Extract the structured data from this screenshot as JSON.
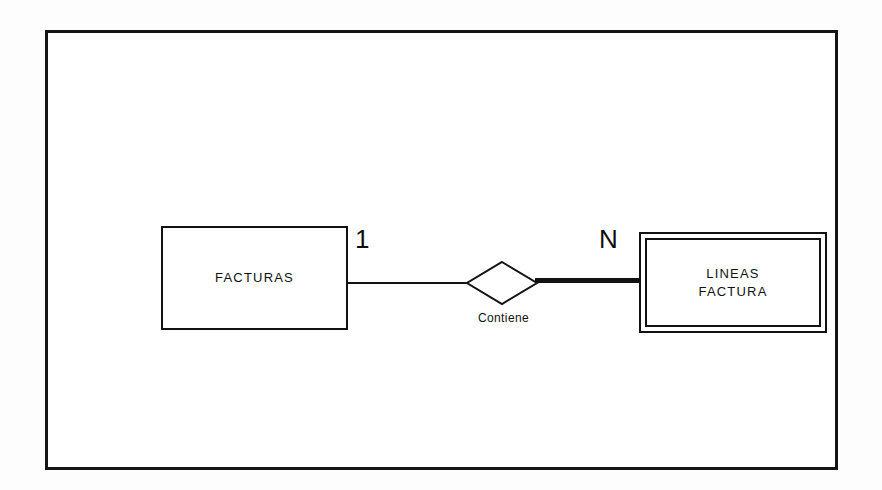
{
  "diagram": {
    "type": "entity-relationship",
    "title": "",
    "frame": {
      "border_color": "#151515",
      "background": "#ffffff"
    },
    "entities": [
      {
        "id": "facturas",
        "label": "FACTURAS",
        "kind": "strong-entity",
        "border_style": "single"
      },
      {
        "id": "lineas-factura",
        "label": "LINEAS\nFACTURA",
        "kind": "weak-entity",
        "border_style": "double"
      }
    ],
    "relationships": [
      {
        "id": "contiene",
        "label": "Contiene",
        "shape": "diamond",
        "from": "facturas",
        "to": "lineas-factura"
      }
    ],
    "cardinalities": {
      "left": "1",
      "right": "N"
    },
    "connectors": [
      {
        "id": "left",
        "style": "thin",
        "participation": "partial"
      },
      {
        "id": "right",
        "style": "bold",
        "participation": "total"
      }
    ]
  }
}
